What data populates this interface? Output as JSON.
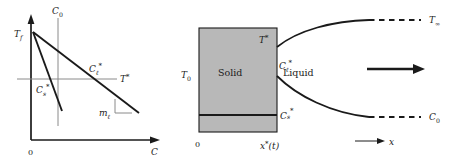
{
  "figure": {
    "panels": [
      {
        "id": "phase-diagram",
        "axes": {
          "x_axis_label": "C",
          "x_origin_label": "0",
          "y_axis_label": ""
        },
        "labels": {
          "fusion_temp": "T",
          "fusion_temp_sub": "f",
          "bulk_conc": "C",
          "bulk_conc_sub": "0",
          "interface_temp": "T",
          "interface_temp_star": "*",
          "liquid_conc": "C",
          "liquid_conc_sub": "ℓ",
          "liquid_conc_star": "*",
          "solid_conc": "C",
          "solid_conc_sub": "s",
          "solid_conc_star": "*",
          "liquidus_slope": "m",
          "liquidus_slope_sub": "ℓ"
        }
      },
      {
        "id": "solidification-front",
        "labels": {
          "solid_region": "Solid",
          "liquid_region": "Liquid",
          "wall_temp": "T",
          "wall_temp_sub": "0",
          "interface_temp": "T",
          "interface_temp_star": "*",
          "far_field_temp": "T",
          "far_field_temp_sub": "∞",
          "liquid_conc": "C",
          "liquid_conc_sub": "ℓ",
          "liquid_conc_star": "*",
          "solid_conc": "C",
          "solid_conc_sub": "s",
          "solid_conc_star": "*",
          "far_field_conc": "C",
          "far_field_conc_sub": "0",
          "origin": "0",
          "front_position": "x",
          "front_position_star": "*",
          "front_position_arg": "(t)",
          "coordinate_axis": "x"
        }
      }
    ],
    "colors": {
      "line": "#1a1a1a",
      "solid_fill": "#b8b8b8",
      "thin_line": "#8a8a8a",
      "background": "#ffffff",
      "text": "#1a1a1a"
    }
  }
}
